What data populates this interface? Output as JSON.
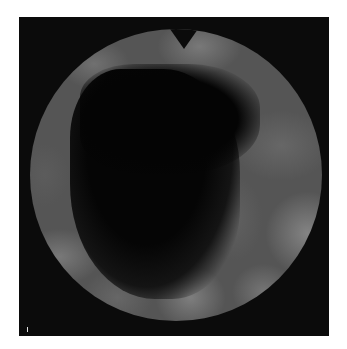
{
  "image": {
    "kind": "endoscopic-view",
    "description": "Circular grayscale endoscopic/fiberoptic image inside a black square frame, with a V-shaped orientation notch at the top",
    "colors": {
      "frame": "#0b0b0b",
      "background": "#ffffff",
      "tissue": "#555555",
      "lumen": "#050505"
    }
  }
}
